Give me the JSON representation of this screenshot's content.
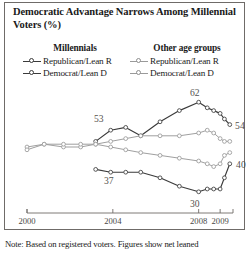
{
  "title": "Democratic Advantage Narrows Among Millennial Voters (%)",
  "note": "Note: Based on registered voters. Figures show net leaned",
  "legend": {
    "groups": [
      {
        "heading": "Millennials",
        "entries": [
          {
            "label": "Republican/Lean R",
            "color": "#3b3b3b",
            "style": "dark"
          },
          {
            "label": "Democrat/Lean D",
            "color": "#3b3b3b",
            "style": "dark"
          }
        ]
      },
      {
        "heading": "Other age groups",
        "entries": [
          {
            "label": "Republican/Lean R",
            "color": "#9a9a9a",
            "style": "light"
          },
          {
            "label": "Democrat/Lean D",
            "color": "#9a9a9a",
            "style": "light"
          }
        ]
      }
    ]
  },
  "chart_data": {
    "type": "line",
    "title": "Democratic Advantage Narrows Among Millennial Voters (%)",
    "xlabel": "",
    "ylabel": "",
    "grid": false,
    "legend_position": "top",
    "xlim": [
      2000,
      2009.6
    ],
    "ylim": [
      26,
      66
    ],
    "xticks": [
      "2000",
      "2004",
      "2008",
      "2009"
    ],
    "xtick_values": [
      2000,
      2004,
      2008,
      2009
    ],
    "annotations": [
      {
        "text": "53",
        "x": 2003.9,
        "y": 53,
        "series": "Millennials Democrat/Lean D"
      },
      {
        "text": "62",
        "x": 2008.0,
        "y": 62,
        "series": "Millennials Democrat/Lean D"
      },
      {
        "text": "54",
        "x": 2009.5,
        "y": 54,
        "series": "Millennials Democrat/Lean D"
      },
      {
        "text": "37",
        "x": 2004.0,
        "y": 37,
        "series": "Millennials Republican/Lean R"
      },
      {
        "text": "30",
        "x": 2008.0,
        "y": 30,
        "series": "Millennials Republican/Lean R"
      },
      {
        "text": "40",
        "x": 2009.5,
        "y": 40,
        "series": "Other age groups Republican/Lean R"
      }
    ],
    "series": [
      {
        "name": "Millennials Democrat/Lean D",
        "color": "#3b3b3b",
        "style": "dark",
        "x": [
          2003.2,
          2003.9,
          2004.6,
          2005.3,
          2006.2,
          2007.1,
          2008.0,
          2008.4,
          2008.7,
          2009.0,
          2009.2,
          2009.45
        ],
        "values": [
          48,
          52,
          53,
          50,
          55,
          59,
          62,
          60,
          59,
          58,
          56,
          54
        ]
      },
      {
        "name": "Millennials Republican/Lean R",
        "color": "#3b3b3b",
        "style": "dark",
        "x": [
          2003.2,
          2003.9,
          2004.6,
          2005.3,
          2006.2,
          2007.1,
          2008.0,
          2008.4,
          2008.7,
          2009.0,
          2009.2,
          2009.45
        ],
        "values": [
          38,
          37,
          37,
          37,
          35,
          32,
          30,
          31,
          31,
          31,
          35,
          40
        ]
      },
      {
        "name": "Other age groups Democrat/Lean D",
        "color": "#9a9a9a",
        "style": "light",
        "x": [
          2000.0,
          2000.8,
          2001.7,
          2002.5,
          2003.2,
          2003.9,
          2004.6,
          2005.3,
          2006.2,
          2007.1,
          2008.0,
          2008.4,
          2008.7,
          2009.0,
          2009.2,
          2009.45
        ],
        "values": [
          46,
          47,
          46,
          46,
          47,
          48,
          49,
          50,
          50,
          50,
          51,
          52,
          51,
          49,
          48,
          48
        ]
      },
      {
        "name": "Other age groups Republican/Lean R",
        "color": "#9a9a9a",
        "style": "light",
        "x": [
          2000.0,
          2000.8,
          2001.7,
          2002.5,
          2003.2,
          2003.9,
          2004.6,
          2005.3,
          2006.2,
          2007.1,
          2008.0,
          2008.4,
          2008.7,
          2009.0,
          2009.2,
          2009.45
        ],
        "values": [
          45,
          47,
          47,
          47,
          47,
          46,
          45,
          44,
          43,
          42,
          41,
          40,
          39,
          40,
          43,
          44
        ]
      }
    ]
  }
}
